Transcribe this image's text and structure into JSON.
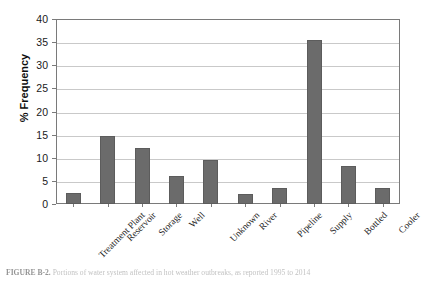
{
  "figure": {
    "caption_label": "FIGURE B-2.",
    "caption_text": "Portions of water system affected in hot weather outbreaks, as reported 1995 to 2014"
  },
  "chart_data": {
    "type": "bar",
    "title": "",
    "subtitle": "",
    "xlabel": "",
    "ylabel": "% Frequency",
    "ylim": [
      0,
      40
    ],
    "ytick_step": 5,
    "ytick_labels": [
      "0",
      "5",
      "10",
      "15",
      "20",
      "25",
      "30",
      "35",
      "40"
    ],
    "grid": true,
    "legend": "none",
    "bar_color": "#6b6b6b",
    "bar_edge_color": "#5c5c5c",
    "gridline_color": "#c9c9c9",
    "frame_color": "#7a7a7a",
    "categories": [
      "Treatment Plant",
      "Reservoir",
      "Storage",
      "Well",
      "Unknown",
      "River",
      "Pipeline",
      "Supply",
      "Bottled",
      "Cooler"
    ],
    "values": [
      2.3,
      14.7,
      12.1,
      6.0,
      9.6,
      2.2,
      3.5,
      35.5,
      8.3,
      3.5
    ]
  }
}
